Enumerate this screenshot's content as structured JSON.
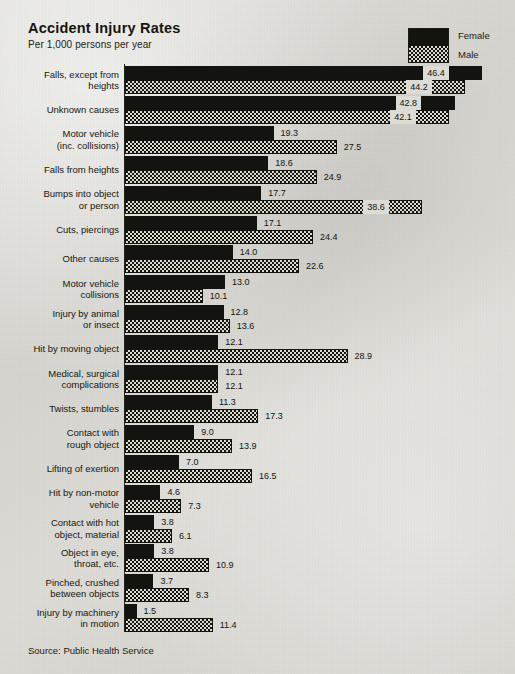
{
  "header": {
    "title": "Accident Injury Rates",
    "subtitle": "Per 1,000 persons per year"
  },
  "legend": {
    "female_label": "Female",
    "male_label": "Male",
    "female_swatch_name": "solid-black-swatch",
    "male_swatch_name": "checkered-swatch"
  },
  "footer": {
    "source": "Source: Public Health Service"
  },
  "colors": {
    "background": "#d9d8d3",
    "ink": "#15150f",
    "female_fill": "#131310",
    "male_fill_dark": "#17170f",
    "male_fill_light": "#dad9d2"
  },
  "chart_data": {
    "type": "bar",
    "orientation": "horizontal",
    "title": "Accident Injury Rates",
    "subtitle": "Per 1,000 persons per year",
    "xlabel": "",
    "ylabel": "",
    "unit": "per 1,000 persons per year",
    "grid": false,
    "axis_ticks_shown": false,
    "legend_position": "top-right",
    "xlim": [
      0,
      46.4
    ],
    "px_per_unit": 7.7,
    "categories": [
      "Falls, except from heights",
      "Unknown causes",
      "Motor vehicle (inc. collisions)",
      "Falls from heights",
      "Bumps into object or person",
      "Cuts, piercings",
      "Other causes",
      "Motor vehicle collisions",
      "Injury by animal or insect",
      "Hit by moving object",
      "Medical, surgical complications",
      "Twists, stumbles",
      "Contact with rough object",
      "Lifting of exertion",
      "Hit by non-motor vehicle",
      "Contact with hot object, material",
      "Object in eye, throat, etc.",
      "Pinched, crushed between objects",
      "Injury by machinery in motion"
    ],
    "category_lines": [
      [
        "Falls, except from",
        "heights"
      ],
      [
        "Unknown causes"
      ],
      [
        "Motor vehicle",
        "(inc. collisions)"
      ],
      [
        "Falls from heights"
      ],
      [
        "Bumps into object",
        "or person"
      ],
      [
        "Cuts, piercings"
      ],
      [
        "Other causes"
      ],
      [
        "Motor vehicle",
        "collisions"
      ],
      [
        "Injury by animal",
        "or insect"
      ],
      [
        "Hit by moving object"
      ],
      [
        "Medical, surgical",
        "complications"
      ],
      [
        "Twists, stumbles"
      ],
      [
        "Contact with",
        "rough object"
      ],
      [
        "Lifting of exertion"
      ],
      [
        "Hit by non-motor",
        "vehicle"
      ],
      [
        "Contact with hot",
        "object, material"
      ],
      [
        "Object in eye,",
        "throat, etc."
      ],
      [
        "Pinched, crushed",
        "between objects"
      ],
      [
        "Injury by machinery",
        "in motion"
      ]
    ],
    "series": [
      {
        "name": "Female",
        "values": [
          46.4,
          42.8,
          19.3,
          18.6,
          17.7,
          17.1,
          14.0,
          13.0,
          12.8,
          12.1,
          12.1,
          11.3,
          9.0,
          7.0,
          4.6,
          3.8,
          3.8,
          3.7,
          1.5
        ],
        "labels": [
          "46.4",
          "42.8",
          "19.3",
          "18.6",
          "17.7",
          "17.1",
          "14.0",
          "13.0",
          "12.8",
          "12.1",
          "12.1",
          "11.3",
          "9.0",
          "7.0",
          "4.6",
          "3.8",
          "3.8",
          "3.7",
          "1.5"
        ],
        "label_placement": [
          "inside",
          "inside",
          "outside",
          "outside",
          "outside",
          "outside",
          "outside",
          "outside",
          "outside",
          "outside",
          "outside",
          "outside",
          "outside",
          "outside",
          "outside",
          "outside",
          "outside",
          "outside",
          "outside"
        ]
      },
      {
        "name": "Male",
        "values": [
          44.2,
          42.1,
          27.5,
          24.9,
          38.6,
          24.4,
          22.6,
          10.1,
          13.6,
          28.9,
          12.1,
          17.3,
          13.9,
          16.5,
          7.3,
          6.1,
          10.9,
          8.3,
          11.4
        ],
        "labels": [
          "44.2",
          "42.1",
          "27.5",
          "24.9",
          "38.6",
          "24.4",
          "22.6",
          "10.1",
          "13.6",
          "28.9",
          "12.1",
          "17.3",
          "13.9",
          "16.5",
          "7.3",
          "6.1",
          "10.9",
          "8.3",
          "11.4"
        ],
        "label_placement": [
          "inside",
          "inside",
          "outside",
          "outside",
          "inside",
          "outside",
          "outside",
          "outside",
          "outside",
          "outside",
          "outside",
          "outside",
          "outside",
          "outside",
          "outside",
          "outside",
          "outside",
          "outside",
          "outside"
        ]
      }
    ]
  }
}
